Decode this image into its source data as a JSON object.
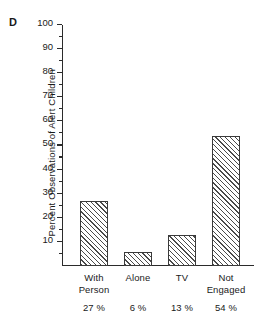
{
  "figure": {
    "panel_letter": "D"
  },
  "chart_data": {
    "type": "bar",
    "title": "",
    "panel_label": "D",
    "xlabel": "",
    "ylabel": "Percent Observations of Alert Children",
    "categories": [
      "With Person",
      "Alone",
      "TV",
      "Not Engaged"
    ],
    "category_lines": [
      [
        "With",
        "Person"
      ],
      [
        "Alone"
      ],
      [
        "TV"
      ],
      [
        "Not",
        "Engaged"
      ]
    ],
    "values": [
      27,
      6,
      13,
      54
    ],
    "value_labels": [
      "27 %",
      "6 %",
      "13 %",
      "54 %"
    ],
    "ylim": [
      0,
      100
    ],
    "yticks": [
      10,
      20,
      30,
      40,
      50,
      60,
      70,
      80,
      90,
      100
    ],
    "ytick_labels": [
      "10",
      "20",
      "30",
      "40",
      "50",
      "60",
      "70",
      "80",
      "90",
      "100"
    ],
    "minor_tick_interval": 5,
    "grid": false,
    "legend": null,
    "bar_fill": "hatched-diagonal",
    "bar_edge_color": "#3a3a3a",
    "axis_color": "#2b2b2b",
    "background_color": "#ffffff"
  }
}
